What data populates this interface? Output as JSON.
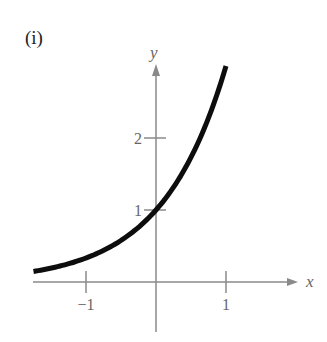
{
  "panel_label": "(i)",
  "chart_data": {
    "type": "line",
    "title": "",
    "function": "y = 3^x",
    "xlabel": "x",
    "ylabel": "y",
    "x_ticks": [
      {
        "value": -1,
        "label": "−1"
      },
      {
        "value": 1,
        "label": "1"
      }
    ],
    "y_ticks": [
      {
        "value": 1,
        "label": "1"
      },
      {
        "value": 2,
        "label": "2"
      }
    ],
    "xlim": [
      -1.77,
      2.0
    ],
    "ylim": [
      -0.8,
      3.0
    ],
    "grid": false,
    "series": [
      {
        "name": "curve",
        "x": [
          -1.75,
          -1.5,
          -1.25,
          -1.0,
          -0.75,
          -0.5,
          -0.25,
          0.0,
          0.25,
          0.5,
          0.75,
          1.0
        ],
        "values": [
          0.146,
          0.192,
          0.253,
          0.333,
          0.439,
          0.577,
          0.76,
          1.0,
          1.316,
          1.732,
          2.28,
          3.0
        ]
      }
    ],
    "colors": {
      "axis": "#8a8a8a",
      "curve": "#0d0d0d",
      "text": "#666666"
    }
  }
}
